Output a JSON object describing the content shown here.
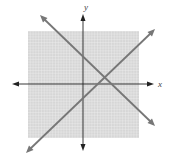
{
  "graph": {
    "axes": {
      "x_label": "x",
      "y_label": "y",
      "origin_px": [
        83,
        84
      ],
      "unit_px": 2.8
    },
    "grid": {
      "x_range": [
        -10,
        10
      ],
      "y_range": [
        -10,
        10
      ],
      "background": "#d9d9d9",
      "line_color": "#f2f2f2"
    },
    "lines": [
      {
        "name": "decreasing-line",
        "color": "#777777",
        "from_px": [
          41,
          16
        ],
        "to_px": [
          154,
          125
        ]
      },
      {
        "name": "increasing-line",
        "color": "#777777",
        "from_px": [
          27,
          152
        ],
        "to_px": [
          154,
          30
        ]
      }
    ],
    "intersection_px": [
      104,
      79
    ]
  }
}
